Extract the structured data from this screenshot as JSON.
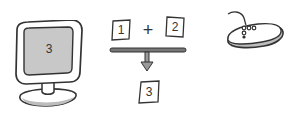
{
  "diagram": {
    "monitor": {
      "screen_value": "3"
    },
    "equation": {
      "operand_left": "1",
      "operator": "+",
      "operand_right": "2",
      "result": "3"
    },
    "mouse": {}
  },
  "colors": {
    "outline": "#333333",
    "screen_fill": "#c8c8c8",
    "bezel_fill": "#ffffff",
    "shadow_fill": "#bdbdbd",
    "bar_fill": "#777777"
  }
}
